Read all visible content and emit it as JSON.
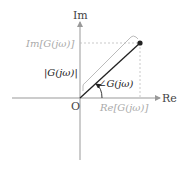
{
  "diagram": {
    "axes": {
      "real_label": "Re",
      "imag_label": "Im",
      "origin_label": "O"
    },
    "labels": {
      "imag_part": "Im[G(jω)]",
      "real_part": "Re[G(jω)]",
      "magnitude": "|G(jω)|",
      "angle": "∠G(jω)"
    },
    "colors": {
      "axis": "#999999",
      "vector": "#222222",
      "projection_text": "#aaaaaa",
      "dashed": "#bbbbbb",
      "bracket": "#aaaaaa"
    }
  }
}
